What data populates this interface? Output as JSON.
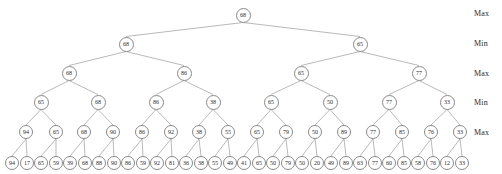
{
  "figure": {
    "type": "game-tree",
    "width": 502,
    "height": 174,
    "node_fill": "#ffffff",
    "node_stroke": "#8a8a8a",
    "edge_color": "#8a8a8a",
    "text_color": "#2b2b2b"
  },
  "level_labels": [
    {
      "text": "Max",
      "x": 474,
      "y": 14
    },
    {
      "text": "Min",
      "x": 474,
      "y": 44
    },
    {
      "text": "Max",
      "x": 474,
      "y": 74
    },
    {
      "text": "Min",
      "x": 474,
      "y": 103
    },
    {
      "text": "Max",
      "x": 474,
      "y": 133
    }
  ],
  "levels": [
    {
      "index": 0,
      "role": "Max",
      "y": 15,
      "radius": 7.5,
      "font_size": 6,
      "values": [
        68
      ],
      "xs": [
        243
      ]
    },
    {
      "index": 1,
      "role": "Min",
      "y": 44,
      "radius": 7.5,
      "font_size": 6,
      "values": [
        68,
        65
      ],
      "xs": [
        126,
        360
      ]
    },
    {
      "index": 2,
      "role": "Max",
      "y": 73,
      "radius": 7.5,
      "font_size": 6,
      "values": [
        68,
        86,
        65,
        77
      ],
      "xs": [
        69,
        184,
        301,
        419
      ]
    },
    {
      "index": 3,
      "role": "Min",
      "y": 102,
      "radius": 7.5,
      "font_size": 6,
      "values": [
        65,
        68,
        86,
        38,
        65,
        50,
        77,
        33
      ],
      "xs": [
        41,
        98,
        156,
        213,
        271,
        330,
        389,
        447
      ]
    },
    {
      "index": 4,
      "role": "Max",
      "y": 132,
      "radius": 7.0,
      "font_size": 6,
      "values": [
        94,
        65,
        68,
        90,
        86,
        92,
        38,
        55,
        65,
        79,
        50,
        89,
        77,
        85,
        76,
        33
      ],
      "xs": [
        26,
        56,
        84,
        113,
        142,
        171,
        199,
        228,
        257,
        286,
        315,
        344,
        373,
        402,
        431,
        460
      ]
    },
    {
      "index": 5,
      "role": "Leaf",
      "y": 163,
      "radius": 7.0,
      "font_size": 6,
      "values": [
        94,
        17,
        65,
        59,
        39,
        68,
        88,
        90,
        86,
        59,
        92,
        81,
        36,
        38,
        55,
        49,
        41,
        65,
        50,
        79,
        50,
        20,
        49,
        89,
        63,
        77,
        60,
        85,
        58,
        76,
        12,
        33
      ],
      "xs": [
        12,
        27,
        41,
        56,
        70,
        85,
        99,
        114,
        128,
        143,
        157,
        172,
        186,
        201,
        215,
        230,
        244,
        259,
        273,
        288,
        302,
        317,
        331,
        346,
        360,
        375,
        389,
        404,
        418,
        433,
        447,
        462
      ]
    }
  ]
}
